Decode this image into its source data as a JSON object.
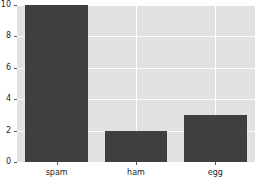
{
  "chart_data": {
    "type": "bar",
    "title": "",
    "subtitle": "",
    "xlabel": "",
    "ylabel": "",
    "categories": [
      "spam",
      "ham",
      "egg"
    ],
    "values": [
      10,
      2,
      3
    ],
    "series": [
      {
        "name": "counts",
        "values": [
          10,
          2,
          3
        ],
        "color": "#404040"
      }
    ],
    "ylim": [
      0,
      10
    ],
    "yticks": [
      0,
      2,
      4,
      6,
      8,
      10
    ],
    "ytick_labels": [
      "0",
      "2",
      "4",
      "6",
      "8",
      "10"
    ],
    "xtick_labels": [
      "spam",
      "ham",
      "egg"
    ],
    "grid": true,
    "grid_axis": "both",
    "legend": false,
    "legend_position": "none",
    "style": {
      "figure_background": "#ffffff",
      "axes_background": "#e1e1e1",
      "grid_color": "#ffffff",
      "bar_color": "#404040",
      "tick_color": "#262626"
    }
  }
}
